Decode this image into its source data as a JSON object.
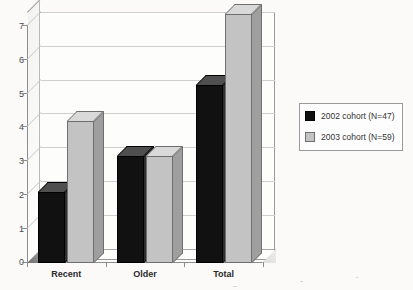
{
  "chart_data": {
    "type": "bar",
    "title": "",
    "subtitle": "",
    "xlabel": "",
    "ylabel": "",
    "categories": [
      "Recent",
      "Older",
      "Total"
    ],
    "series": [
      {
        "name": "2002 cohort (N=47)",
        "values": [
          2,
          3,
          5
        ],
        "color": "#111111"
      },
      {
        "name": "2003 cohort (N=59)",
        "values": [
          4,
          3,
          7
        ],
        "color": "#c3c3c3"
      }
    ],
    "ylim": [
      0,
      7
    ],
    "ytick_labels": [
      "0",
      "1",
      "2",
      "3",
      "4",
      "5",
      "6",
      "7"
    ],
    "ytick_values": [
      0,
      1,
      2,
      3,
      4,
      5,
      6,
      7
    ],
    "grid": true,
    "grid_axis": "y",
    "legend_position": "right",
    "style": "3d-column",
    "annotations": []
  },
  "legend": {
    "entries": [
      {
        "label": "2002 cohort (N=47)",
        "swatch": "black-square-swatch"
      },
      {
        "label": "2003 cohort (N=59)",
        "swatch": "gray-square-swatch"
      }
    ]
  },
  "axes": {
    "y": {
      "labels": [
        "7",
        "6",
        "5",
        "4",
        "3",
        "2",
        "1",
        "0"
      ]
    },
    "x": {
      "labels": [
        "Recent",
        "Older",
        "Total"
      ]
    }
  }
}
